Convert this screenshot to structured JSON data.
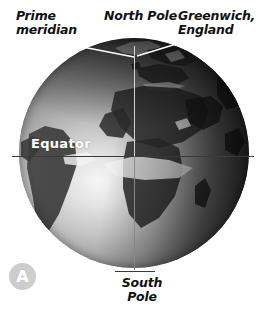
{
  "figure": {
    "panel_badge": "A",
    "background_color": "#ffffff"
  },
  "labels": {
    "prime_meridian": "Prime\nmeridian",
    "north_pole": "North Pole",
    "greenwich": "Greenwich,\nEngland",
    "equator": "Equator",
    "south_pole": "South\nPole"
  },
  "globe": {
    "projection": "orthographic",
    "centered_on": "Africa / Atlantic Ocean",
    "style": "grayscale photographic",
    "visible_landmasses": [
      "Africa",
      "South America",
      "Europe",
      "Arabian Peninsula",
      "Greenland",
      "Madagascar",
      "India"
    ],
    "graticule": {
      "equator_color": "#3a3a3a",
      "meridian_color": "#e1e1e1"
    },
    "shading": {
      "highlight_color": "#f6f6f6",
      "midtone_color": "#9a9a9a",
      "terminator_color": "#2b2b2b"
    }
  },
  "leader_lines": {
    "color": "#ffffff",
    "count": 2,
    "targets": [
      "prime-meridian",
      "greenwich-england"
    ]
  }
}
